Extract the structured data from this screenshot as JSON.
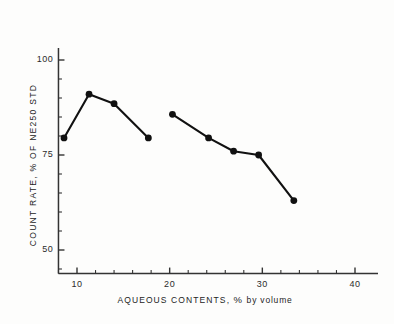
{
  "chart_data": {
    "type": "line",
    "title": "",
    "xlabel": "AQUEOUS CONTENTS, % by volume",
    "ylabel": "COUNT RATE, % OF NE250 STD",
    "xlim": [
      6,
      42
    ],
    "ylim": [
      43,
      106
    ],
    "grid": false,
    "legend": "none",
    "x_major_ticks": [
      10,
      20,
      30,
      40
    ],
    "x_major_tick_labels": [
      "10",
      "20",
      "30",
      "40"
    ],
    "x_minor_tick_interval": 2,
    "y_major_ticks": [
      50,
      75,
      100
    ],
    "y_major_tick_labels": [
      "50",
      "75",
      "100"
    ],
    "y_minor_tick_interval": 5,
    "marker": "filled-circle",
    "marker_color": "#111111",
    "line_color": "#111111",
    "axis_color": "#333333",
    "background_color": "#fdfdfc",
    "series": [
      {
        "name": "Series 1",
        "x": [
          8.6,
          11.3,
          14.0,
          17.7
        ],
        "y": [
          79.5,
          91.0,
          88.5,
          79.5
        ]
      },
      {
        "name": "Series 2",
        "x": [
          20.3,
          24.2,
          26.9,
          29.6,
          33.4
        ],
        "y": [
          85.7,
          79.5,
          76.0,
          75.0,
          63.0
        ]
      }
    ]
  },
  "axis_titles": {
    "x_prefix": "AQUEOUS CONTENTS,",
    "x_percent": "%",
    "x_suffix": "by  volume",
    "y_full": "COUNT RATE, % OF NE250 STD"
  }
}
